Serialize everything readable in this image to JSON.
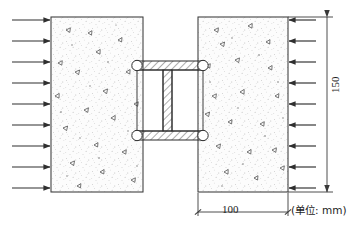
{
  "drawing": {
    "title": "Concrete blocks connected by steel I-section under lateral compression",
    "units_note": "(单位: mm)",
    "colors": {
      "line": "#2b2b2b",
      "arrow": "#333333",
      "hatch": "#555555",
      "concrete_fill": "#fbfbfb",
      "steel_fill": "#ffffff",
      "dim": "#3a3a3a"
    }
  },
  "dimensions": {
    "vertical": {
      "value": "150",
      "label": "150"
    },
    "horizontal": {
      "value": "100",
      "label": "100"
    }
  },
  "blocks": [
    {
      "name": "left-concrete-block",
      "x": 51,
      "y": 17,
      "w": 92,
      "h": 175
    },
    {
      "name": "right-concrete-block",
      "x": 198,
      "y": 17,
      "w": 90,
      "h": 175
    }
  ],
  "connector": {
    "name": "steel-i-section",
    "top_flange": {
      "x": 137,
      "y": 61,
      "w": 66,
      "h": 9
    },
    "bottom_flange": {
      "x": 137,
      "y": 131,
      "w": 66,
      "h": 9
    },
    "web": {
      "x": 163,
      "y": 61,
      "w": 9,
      "h": 79
    },
    "bolts": [
      {
        "name": "bolt-top-left",
        "cx": 137,
        "cy": 65.5,
        "r": 5.2
      },
      {
        "name": "bolt-top-right",
        "cx": 203,
        "cy": 65.5,
        "r": 5.2
      },
      {
        "name": "bolt-bottom-left",
        "cx": 137,
        "cy": 135.5,
        "r": 5.2
      },
      {
        "name": "bolt-bottom-right",
        "cx": 203,
        "cy": 135.5,
        "r": 5.2
      }
    ]
  },
  "load_arrows": {
    "left": {
      "count": 9,
      "direction": "right",
      "x_start": 12,
      "x_end": 51,
      "y": [
        20,
        41,
        62,
        83,
        104,
        125,
        146,
        167,
        188
      ]
    },
    "right": {
      "count": 9,
      "direction": "left",
      "x_start": 288,
      "x_end": 298,
      "y": [
        20,
        41,
        62,
        83,
        104,
        125,
        146,
        167,
        188
      ]
    }
  }
}
